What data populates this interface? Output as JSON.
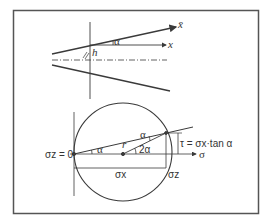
{
  "diagram": {
    "top": {
      "x_bar_label": "x̄",
      "x_label": "x",
      "alpha_label": "α",
      "h_label": "h"
    },
    "mohr": {
      "sigma_z_zero_label": "σz = 0",
      "alpha_left_label": "α",
      "alpha_top_label": "α",
      "r_label": "r",
      "two_alpha_label": "2α",
      "tau_label": "τ = σx·tan α",
      "sigma_axis_label": "σ",
      "sigma_x_label": "σx",
      "sigma_z_label": "σz"
    },
    "colors": {
      "stroke": "#3a3a3a",
      "frame": "#555555",
      "background": "#ffffff"
    }
  }
}
